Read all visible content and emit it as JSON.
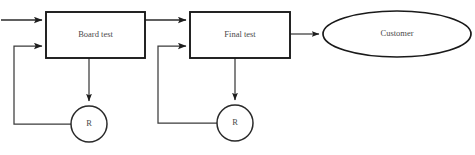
{
  "diagram": {
    "type": "process-flow",
    "background_color": "#ffffff",
    "line_color": "#3b3b3b",
    "shape_stroke_color": "#1a1a1a",
    "text_color": "#4a4a4a",
    "nodes": [
      {
        "id": "board-test",
        "shape": "rectangle",
        "label": "Board test",
        "x": 46,
        "y": 12,
        "width": 99,
        "height": 46
      },
      {
        "id": "final-test",
        "shape": "rectangle",
        "label": "Final test",
        "x": 190,
        "y": 12,
        "width": 100,
        "height": 46
      },
      {
        "id": "customer",
        "shape": "ellipse",
        "label": "Customer",
        "cx": 397,
        "cy": 34,
        "rx": 74,
        "ry": 23
      },
      {
        "id": "rework-board",
        "shape": "circle",
        "label": "R",
        "cx": 89,
        "cy": 124,
        "r": 18
      },
      {
        "id": "rework-final",
        "shape": "circle",
        "label": "R",
        "cx": 235,
        "cy": 123,
        "r": 18
      }
    ],
    "connectors": [
      {
        "id": "input-to-board-test",
        "from": "input",
        "to": "board-test",
        "style": "arrow"
      },
      {
        "id": "board-test-to-final-test",
        "from": "board-test",
        "to": "final-test",
        "style": "arrow"
      },
      {
        "id": "final-test-to-customer",
        "from": "final-test",
        "to": "customer",
        "style": "arrow"
      },
      {
        "id": "board-test-to-rework-board",
        "from": "board-test",
        "to": "rework-board",
        "style": "arrow"
      },
      {
        "id": "final-test-to-rework-final",
        "from": "final-test",
        "to": "rework-final",
        "style": "arrow"
      },
      {
        "id": "rework-board-to-board-test",
        "from": "rework-board",
        "to": "board-test",
        "style": "feedback-arrow"
      },
      {
        "id": "rework-final-to-final-test",
        "from": "rework-final",
        "to": "final-test",
        "style": "feedback-arrow"
      }
    ]
  }
}
